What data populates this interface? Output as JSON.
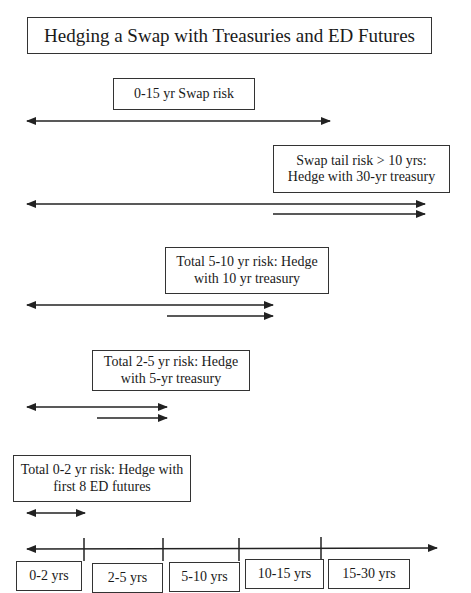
{
  "title": "Hedging a Swap with Treasuries and ED Futures",
  "boxes": {
    "swap_risk": "0-15 yr Swap risk",
    "tail_risk_line1": "Swap tail risk  > 10 yrs:",
    "tail_risk_line2": "Hedge with 30-yr treasury",
    "five_ten_line1": "Total 5-10 yr risk:  Hedge",
    "five_ten_line2": "with 10 yr treasury",
    "two_five_line1": "Total 2-5 yr risk: Hedge",
    "two_five_line2": "with 5-yr treasury",
    "zero_two_line1": "Total 0-2 yr risk: Hedge with",
    "zero_two_line2": "first 8 ED futures"
  },
  "timeline": {
    "segments": [
      "0-2 yrs",
      "2-5 yrs",
      "5-10 yrs",
      "10-15 yrs",
      "15-30 yrs"
    ]
  }
}
